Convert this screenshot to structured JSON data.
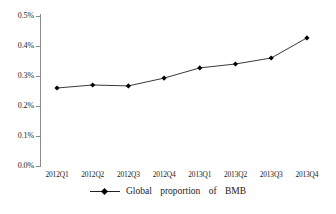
{
  "chart_data": {
    "type": "line",
    "title": "",
    "subtitle": "",
    "xlabel": "",
    "ylabel": "",
    "categories": [
      "2012Q1",
      "2012Q2",
      "2012Q3",
      "2012Q4",
      "2013Q1",
      "2013Q2",
      "2013Q3",
      "2013Q4"
    ],
    "series": [
      {
        "name": "Global proportion of BMB",
        "values": [
          0.26,
          0.27,
          0.267,
          0.293,
          0.327,
          0.34,
          0.36,
          0.427
        ],
        "value_labels": [
          "0.26%",
          "0.27%",
          "0.267%",
          "0.293%",
          "0.327%",
          "0.34%",
          "0.36%",
          "0.427%"
        ],
        "color": "#222222",
        "marker": "diamond"
      }
    ],
    "ylim": [
      0.0,
      0.5
    ],
    "ytick_values": [
      0.0,
      0.1,
      0.2,
      0.3,
      0.4,
      0.5
    ],
    "ytick_labels": [
      "0.0%",
      "0.1%",
      "0.2%",
      "0.3%",
      "0.4%",
      "0.5%"
    ],
    "grid": false,
    "legend_position": "bottom",
    "legend": [
      "Global proportion of BMB"
    ],
    "axis_color": "#8a8a8a"
  },
  "legend": {
    "label": "Global    proportion    of    BMB"
  },
  "yaxis": {
    "labels": [
      "0.5%",
      "0.4%",
      "0.3%",
      "0.2%",
      "0.1%",
      "0.0%"
    ]
  },
  "xaxis": {
    "labels": [
      "2012Q1",
      "2012Q2",
      "2012Q3",
      "2012Q4",
      "2013Q1",
      "2013Q2",
      "2013Q3",
      "2013Q4"
    ]
  }
}
